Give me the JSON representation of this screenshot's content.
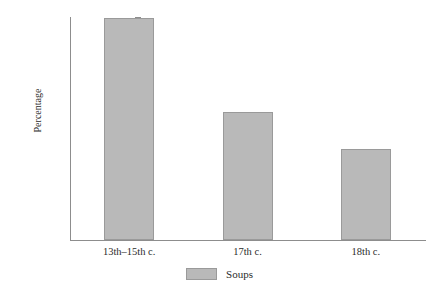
{
  "chart_data": {
    "type": "bar",
    "title": "",
    "subtitle": "",
    "xlabel": "",
    "ylabel": "Percentage",
    "categories": [
      "13th–15th c.",
      "17th c.",
      "18th c."
    ],
    "series": [
      {
        "name": "Soups",
        "values": [
          27.0,
          15.6,
          11.1
        ],
        "color": "#b9b9b9"
      }
    ],
    "ylim": [
      0,
      27.0
    ],
    "yticks": [
      2.7,
      5.4,
      8.1,
      10.8,
      13.5,
      16.2,
      18.9,
      21.6,
      24.3,
      27.0
    ],
    "ytick_labels": [
      "2.7",
      "5.4",
      "8.1",
      "10.8",
      "13.5",
      "16.2",
      "18.9",
      "21.6",
      "24.3",
      "27.0"
    ],
    "grid": false,
    "legend": {
      "position": "bottom",
      "entries": [
        {
          "label": "Soups",
          "color": "#b9b9b9"
        }
      ]
    },
    "annotations": [],
    "axis_color": "#8d8d8d",
    "background": "#ffffff"
  }
}
